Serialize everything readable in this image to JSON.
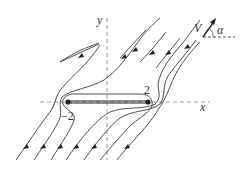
{
  "diagram": {
    "axes": {
      "x_label": "x",
      "y_label": "y"
    },
    "plate": {
      "left_label": "−2",
      "right_label": "2"
    },
    "freestream": {
      "velocity_label": "V",
      "angle_label": "α"
    },
    "colors": {
      "streamline": "#3a3a3a",
      "axis": "#9a9a9a",
      "plate": "#222222"
    }
  }
}
